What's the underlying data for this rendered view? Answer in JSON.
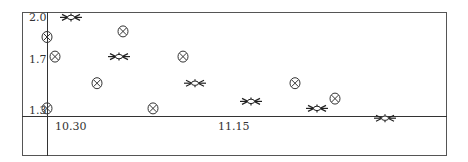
{
  "chart_data": {
    "type": "scatter",
    "title": "",
    "xlabel": "",
    "ylabel": "",
    "x_tick_labels": [
      "10.30",
      "11.15"
    ],
    "y_tick_labels": [
      "2.0",
      "1.7",
      "1.3"
    ],
    "xlim": [
      10.18,
      12.72
    ],
    "ylim": [
      1.0,
      2.03
    ],
    "grid": false,
    "legend": null,
    "series": [
      {
        "name": "circle-x markers",
        "marker": "circle-x",
        "points": [
          {
            "x": 10.2,
            "y": 1.85
          },
          {
            "x": 10.24,
            "y": 1.71
          },
          {
            "x": 10.58,
            "y": 1.89
          },
          {
            "x": 10.45,
            "y": 1.52
          },
          {
            "x": 10.73,
            "y": 1.34
          },
          {
            "x": 10.88,
            "y": 1.71
          },
          {
            "x": 10.2,
            "y": 1.34
          },
          {
            "x": 11.44,
            "y": 1.52
          },
          {
            "x": 11.64,
            "y": 1.41
          }
        ]
      },
      {
        "name": "star markers",
        "marker": "star",
        "points": [
          {
            "x": 10.32,
            "y": 1.99
          },
          {
            "x": 10.56,
            "y": 1.71
          },
          {
            "x": 10.94,
            "y": 1.52
          },
          {
            "x": 11.22,
            "y": 1.39
          },
          {
            "x": 11.55,
            "y": 1.34
          },
          {
            "x": 11.89,
            "y": 1.27
          }
        ]
      }
    ]
  }
}
